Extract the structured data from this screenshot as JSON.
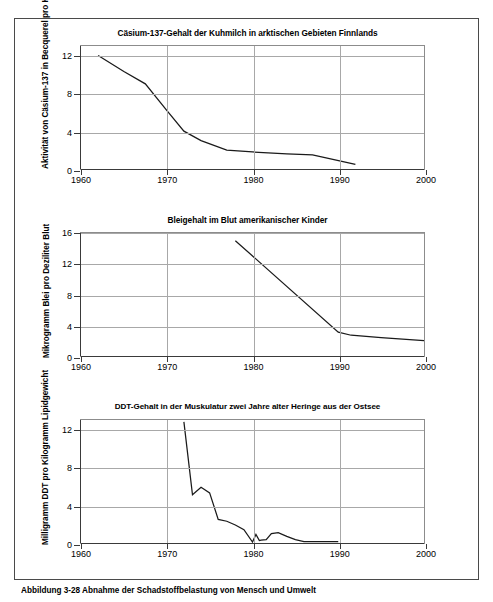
{
  "figure": {
    "caption": "Abbildung 3-28 Abnahme der Schadstoffbelastung von Mensch und Umwelt",
    "frame_color": "#4a4a4a",
    "line_color": "#1a1a1a",
    "grid_color": "#a8a8a8"
  },
  "chart_data": [
    {
      "type": "line",
      "title": "Cäsium-137-Gehalt der Kuhmilch in arktischen Gebieten Finnlands",
      "xlabel": "",
      "ylabel": "Aktivität von Cäsium-137 in Becquerel pro Kilogramm",
      "xlim": [
        1960,
        2000
      ],
      "ylim": [
        0,
        13
      ],
      "xticks": [
        1960,
        1970,
        1980,
        1990,
        2000
      ],
      "xticklabels": [
        "1960",
        "1970",
        "1980",
        "1990",
        "2000"
      ],
      "yticks": [
        0,
        4,
        8,
        12
      ],
      "yticklabels": [
        "0",
        "4",
        "8",
        "12"
      ],
      "grid": true,
      "legend": "none",
      "series": [
        {
          "name": "Cäsium-137 in Kuhmilch",
          "x": [
            1962,
            1965,
            1967.5,
            1970,
            1972,
            1974,
            1977,
            1980,
            1984,
            1987,
            1989.5,
            1992
          ],
          "y": [
            12.0,
            10.3,
            9.0,
            6.2,
            4.0,
            3.0,
            2.0,
            1.8,
            1.6,
            1.5,
            1.0,
            0.5
          ]
        }
      ]
    },
    {
      "type": "line",
      "title": "Bleigehalt im Blut amerikanischer Kinder",
      "xlabel": "",
      "ylabel": "Mikrogramm Blei pro Deziliter Blut",
      "xlim": [
        1960,
        2000
      ],
      "ylim": [
        0,
        16
      ],
      "xticks": [
        1960,
        1970,
        1980,
        1990,
        2000
      ],
      "xticklabels": [
        "1960",
        "1970",
        "1980",
        "1990",
        "2000"
      ],
      "yticks": [
        0,
        4,
        8,
        12,
        16
      ],
      "yticklabels": [
        "0",
        "4",
        "8",
        "12",
        "16"
      ],
      "grid": true,
      "legend": "none",
      "series": [
        {
          "name": "Blei im Blut",
          "x": [
            1978,
            1990,
            1991.5,
            1995,
            2000
          ],
          "y": [
            15.0,
            3.1,
            2.7,
            2.4,
            2.0
          ]
        }
      ]
    },
    {
      "type": "line",
      "title": "DDT-Gehalt in der Muskulatur zwei Jahre alter Heringe aus der Ostsee",
      "xlabel": "",
      "ylabel": "Milligramm DDT pro Kilogramm Lipidgewicht",
      "xlim": [
        1960,
        2000
      ],
      "ylim": [
        0,
        13
      ],
      "xticks": [
        1960,
        1970,
        1980,
        1990,
        2000
      ],
      "xticklabels": [
        "1960",
        "1970",
        "1980",
        "1990",
        "2000"
      ],
      "yticks": [
        0,
        4,
        8,
        12
      ],
      "yticklabels": [
        "0",
        "4",
        "8",
        "12"
      ],
      "grid": true,
      "legend": "none",
      "series": [
        {
          "name": "DDT in Heringen",
          "x": [
            1972,
            1973,
            1974,
            1975,
            1976,
            1977,
            1978,
            1979,
            1980,
            1980.4,
            1980.8,
            1981,
            1981.6,
            1982.2,
            1983,
            1984,
            1985,
            1986,
            1988,
            1990
          ],
          "y": [
            12.8,
            5.1,
            5.9,
            5.3,
            2.5,
            2.3,
            1.9,
            1.4,
            0.1,
            0.9,
            0.25,
            0.3,
            0.35,
            1.0,
            1.1,
            0.7,
            0.35,
            0.15,
            0.15,
            0.15
          ]
        }
      ]
    }
  ]
}
